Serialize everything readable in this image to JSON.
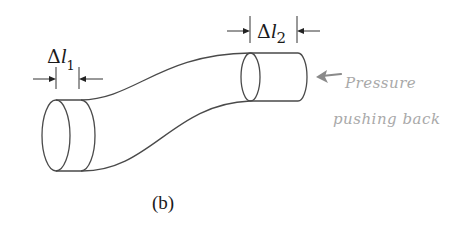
{
  "diagram": {
    "caption": "(b)",
    "labels": {
      "delta_l1": {
        "symbol": "Δ",
        "variable": "l",
        "subscript": "1"
      },
      "delta_l2": {
        "symbol": "Δ",
        "variable": "l",
        "subscript": "2"
      }
    },
    "annotation": {
      "line1": "Pressure",
      "line2": "pushing back",
      "color": "#a9a9a9"
    },
    "colors": {
      "outline": "#4a4a4a",
      "dimension": "#333333",
      "background": "#ffffff"
    }
  }
}
